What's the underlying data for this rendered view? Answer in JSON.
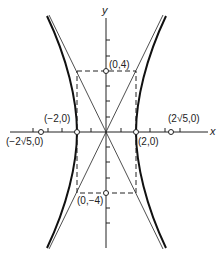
{
  "diagram": {
    "type": "hyperbola",
    "equation_implied": "x^2/4 - y^2/16 = 1",
    "axes": {
      "x_label": "x",
      "y_label": "y"
    },
    "points": [
      {
        "id": "vertex-right",
        "label": "(2,0)",
        "x": 2,
        "y": 0
      },
      {
        "id": "vertex-left",
        "label": "(−2,0)",
        "x": -2,
        "y": 0
      },
      {
        "id": "co-vertex-top",
        "label": "(0,4)",
        "x": 0,
        "y": 4
      },
      {
        "id": "co-vertex-bottom",
        "label": "(0,−4)",
        "x": 0,
        "y": -4
      },
      {
        "id": "focus-right",
        "label": "(2√5,0)",
        "x": 4.472,
        "y": 0
      },
      {
        "id": "focus-left",
        "label": "(−2√5,0)",
        "x": -4.472,
        "y": 0
      }
    ],
    "asymptotes": [
      "y = 2x",
      "y = -2x"
    ],
    "rectangle": {
      "x": [
        -2,
        2
      ],
      "y": [
        -4,
        4
      ],
      "style": "dashed"
    },
    "colors": {
      "ink": "#222222",
      "background": "#ffffff"
    }
  }
}
